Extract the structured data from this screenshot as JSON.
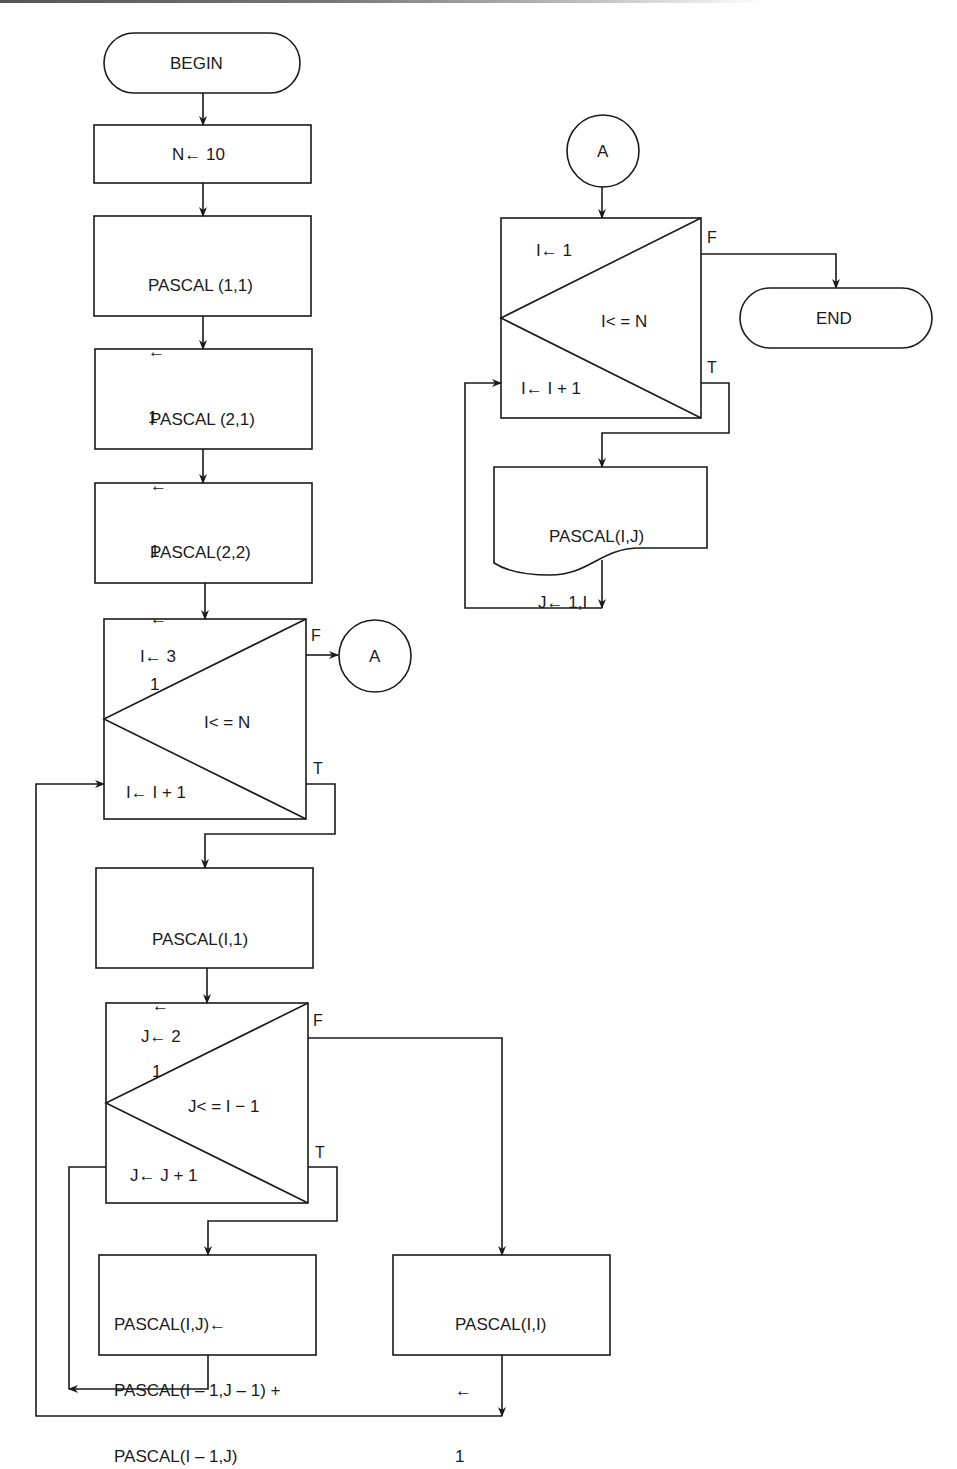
{
  "diagram": {
    "type": "flowchart",
    "colors": {
      "stroke": "#1a1a1a",
      "background": "#ffffff"
    },
    "nodes": {
      "begin": {
        "shape": "terminator",
        "label": "BEGIN"
      },
      "init_n": {
        "shape": "process",
        "label": "N← 10"
      },
      "p11": {
        "shape": "process",
        "lines": [
          "PASCAL (1,1)",
          "←",
          "1"
        ]
      },
      "p21": {
        "shape": "process",
        "lines": [
          "PASCAL (2,1)",
          "←",
          "1"
        ]
      },
      "p22": {
        "shape": "process",
        "lines": [
          "PASCAL(2,2)",
          "←",
          "1"
        ]
      },
      "loop_i": {
        "shape": "loop",
        "init": "I← 3",
        "condition": "I< = N",
        "increment": "I← I + 1",
        "false_label": "F",
        "true_label": "T"
      },
      "connector_a_out": {
        "shape": "connector",
        "label": "A"
      },
      "pi1": {
        "shape": "process",
        "lines": [
          "PASCAL(I,1)",
          "←",
          "1"
        ]
      },
      "loop_j": {
        "shape": "loop",
        "init": "J← 2",
        "condition": "J< = I − 1",
        "increment": "J← J + 1",
        "false_label": "F",
        "true_label": "T"
      },
      "pij": {
        "shape": "process",
        "lines": [
          "PASCAL(I,J)←",
          "PASCAL(I – 1,J – 1) +",
          "PASCAL(I – 1,J)"
        ]
      },
      "pii": {
        "shape": "process",
        "lines": [
          "PASCAL(I,I)",
          "←",
          "1"
        ]
      },
      "connector_a_in": {
        "shape": "connector",
        "label": "A"
      },
      "loop_out": {
        "shape": "loop",
        "init": "I← 1",
        "condition": "I< = N",
        "increment": "I← I + 1",
        "false_label": "F",
        "true_label": "T"
      },
      "print": {
        "shape": "document",
        "lines": [
          "PASCAL(I,J)",
          "J← 1,I"
        ]
      },
      "end": {
        "shape": "terminator",
        "label": "END"
      }
    }
  }
}
